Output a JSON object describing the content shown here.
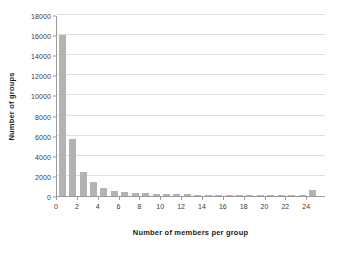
{
  "chart_data": {
    "type": "bar",
    "title": "",
    "xlabel": "Number of members per group",
    "ylabel": "Number of groups",
    "xlim": [
      0,
      25.8
    ],
    "ylim": [
      0,
      18000
    ],
    "grid": true,
    "legend": null,
    "bar_color": "#b3b3b3",
    "gridline_color": "#dedede",
    "axis_color": "#9a9a9a",
    "background": "#ffffff",
    "xticks": [
      0,
      2,
      4,
      6,
      8,
      10,
      12,
      14,
      16,
      18,
      20,
      22,
      24
    ],
    "xtick_labels": [
      "0",
      "2",
      "4",
      "6",
      "8",
      "10",
      "12",
      "14",
      "16",
      "18",
      "20",
      "22",
      "24"
    ],
    "yticks": [
      0,
      2000,
      4000,
      6000,
      8000,
      10000,
      12000,
      14000,
      16000,
      18000
    ],
    "ytick_labels": [
      "0",
      "2000",
      "4000",
      "6000",
      "8000",
      "10000",
      "12000",
      "14000",
      "16000",
      "18000"
    ],
    "categories": [
      1,
      2,
      3,
      4,
      5,
      6,
      7,
      8,
      9,
      10,
      11,
      12,
      13,
      14,
      15,
      16,
      17,
      18,
      19,
      20,
      21,
      22,
      23,
      24,
      25
    ],
    "values": [
      16050,
      5700,
      2400,
      1400,
      800,
      520,
      400,
      300,
      260,
      230,
      200,
      180,
      160,
      140,
      130,
      120,
      110,
      100,
      95,
      90,
      85,
      80,
      75,
      70,
      600
    ]
  }
}
